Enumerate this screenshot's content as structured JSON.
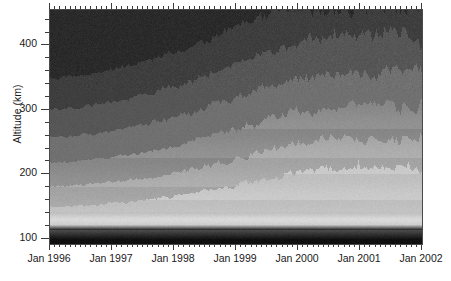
{
  "figure": {
    "width": 451,
    "height": 281,
    "background": "#ffffff",
    "frame_color": "#4a4a4a"
  },
  "axes": {
    "y_title": "Altitude (km)",
    "x_title": "",
    "y_ticks": [
      {
        "value": 100,
        "label": "100"
      },
      {
        "value": 200,
        "label": "200"
      },
      {
        "value": 300,
        "label": "300"
      },
      {
        "value": 400,
        "label": "400"
      }
    ],
    "y_minor_step": 20,
    "x_ticks": [
      {
        "value": 1996.0,
        "label": "Jan 1996"
      },
      {
        "value": 1997.0,
        "label": "Jan 1997"
      },
      {
        "value": 1998.0,
        "label": "Jan 1998"
      },
      {
        "value": 1999.0,
        "label": "Jan 1999"
      },
      {
        "value": 2000.0,
        "label": "Jan 2000"
      },
      {
        "value": 2001.0,
        "label": "Jan 2001"
      },
      {
        "value": 2002.0,
        "label": "Jan 2002"
      }
    ],
    "x_minor_label": "monthly"
  },
  "chart_data": {
    "type": "heatmap",
    "title": "",
    "xlabel": "",
    "ylabel": "Altitude (km)",
    "colormap": "grayscale",
    "colormap_note": "light = high value, dark = low value",
    "xlim": [
      1996.0,
      2002.0
    ],
    "ylim": [
      92,
      455
    ],
    "grid": false,
    "legend": "none",
    "x": [
      1996.0,
      1996.25,
      1996.5,
      1996.75,
      1997.0,
      1997.25,
      1997.5,
      1997.75,
      1998.0,
      1998.25,
      1998.5,
      1998.75,
      1999.0,
      1999.25,
      1999.5,
      1999.75,
      2000.0,
      2000.25,
      2000.5,
      2000.75,
      2001.0,
      2001.25,
      2001.5,
      2001.75,
      2002.0
    ],
    "y": [
      100,
      120,
      140,
      160,
      180,
      200,
      220,
      240,
      260,
      280,
      300,
      320,
      340,
      360,
      380,
      400,
      420,
      440
    ],
    "band_boundaries_km": {
      "note": "Approximate altitude of each grayscale contour boundary over time; boundaries rise with the solar cycle from 1996 (solar min) to 2001-2002 (solar max).",
      "levels": [
        "L1-brightest",
        "L2",
        "L3",
        "L4",
        "L5",
        "L6",
        "L7-darkest"
      ],
      "series": [
        {
          "name": "L2 boundary",
          "values": [
            150,
            150,
            152,
            153,
            155,
            157,
            160,
            163,
            166,
            170,
            174,
            178,
            183,
            188,
            193,
            198,
            203,
            207,
            210,
            212,
            213,
            213,
            212,
            211,
            210
          ]
        },
        {
          "name": "L3 boundary",
          "values": [
            182,
            182,
            184,
            186,
            188,
            191,
            194,
            198,
            202,
            207,
            212,
            218,
            224,
            230,
            236,
            242,
            247,
            251,
            254,
            256,
            257,
            257,
            256,
            255,
            254
          ]
        },
        {
          "name": "L4 boundary",
          "values": [
            218,
            219,
            221,
            223,
            226,
            230,
            234,
            239,
            244,
            250,
            256,
            263,
            270,
            277,
            284,
            290,
            296,
            300,
            303,
            305,
            306,
            306,
            305,
            304,
            303
          ]
        },
        {
          "name": "L5 boundary",
          "values": [
            258,
            259,
            261,
            264,
            268,
            272,
            277,
            283,
            289,
            296,
            303,
            311,
            319,
            327,
            335,
            342,
            348,
            353,
            356,
            358,
            359,
            359,
            358,
            357,
            356
          ]
        },
        {
          "name": "L6 boundary",
          "values": [
            300,
            302,
            305,
            308,
            312,
            317,
            323,
            330,
            337,
            345,
            353,
            362,
            371,
            380,
            389,
            397,
            404,
            409,
            413,
            415,
            416,
            416,
            415,
            414,
            413
          ]
        },
        {
          "name": "L7 boundary",
          "values": [
            348,
            350,
            353,
            357,
            362,
            368,
            375,
            383,
            391,
            400,
            409,
            419,
            429,
            438,
            447,
            455,
            455,
            455,
            455,
            455,
            455,
            455,
            455,
            455,
            455
          ]
        }
      ]
    },
    "fixed_features": [
      {
        "name": "E-region bright layer",
        "altitude_km": 130,
        "shade": "brightest",
        "description": "Narrow high-intensity band just above 120 km, constant in time"
      },
      {
        "name": "sub-E dark layer",
        "altitude_km": 105,
        "shade": "darkest",
        "description": "Dark band below ~115 km, constant in time"
      }
    ],
    "variability_note": "High-frequency (day-to-day) jitter of +/- 10-25 km superimposed on all boundaries, strongest after 1999."
  },
  "icons": {}
}
